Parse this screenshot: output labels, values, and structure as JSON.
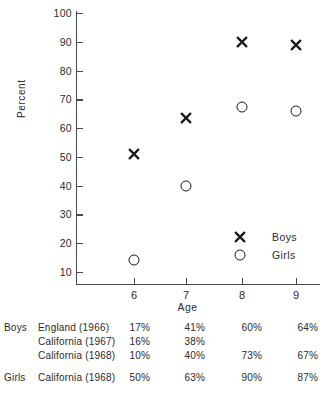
{
  "chart_data": {
    "type": "scatter",
    "title": "",
    "xlabel": "Age",
    "ylabel": "Percent",
    "x": [
      6,
      7,
      8,
      9
    ],
    "xticklabels": [
      "6",
      "7",
      "8",
      "9"
    ],
    "yticks": [
      10,
      20,
      30,
      40,
      50,
      60,
      70,
      80,
      90,
      100
    ],
    "yticklabels": [
      "10",
      "20",
      "30",
      "40",
      "50",
      "60",
      "70",
      "80",
      "90",
      "100"
    ],
    "ylim": [
      0,
      100
    ],
    "grid": false,
    "legend_position": "inside-lower-right",
    "series": [
      {
        "name": "Boys",
        "marker": "x",
        "values": [
          51,
          63.5,
          90,
          89
        ]
      },
      {
        "name": "Girls",
        "marker": "o",
        "values": [
          14,
          40,
          67.5,
          66
        ]
      }
    ],
    "table": {
      "columns": [
        "6",
        "7",
        "8",
        "9"
      ],
      "rows": [
        {
          "group": "Boys",
          "source": "England (1966)",
          "values": [
            "17%",
            "41%",
            "60%",
            "64%"
          ]
        },
        {
          "group": "",
          "source": "California (1967)",
          "values": [
            "16%",
            "38%",
            "",
            ""
          ]
        },
        {
          "group": "",
          "source": "California (1968)",
          "values": [
            "10%",
            "40%",
            "73%",
            "67%"
          ]
        },
        {
          "group": "Girls",
          "source": "California (1968)",
          "values": [
            "50%",
            "63%",
            "90%",
            "87%"
          ]
        }
      ]
    }
  },
  "legend": {
    "items": [
      {
        "symbol": "x-marker",
        "label": "Boys"
      },
      {
        "symbol": "o-marker",
        "label": "Girls"
      }
    ]
  },
  "colors": {
    "axis": "#4a4a4a",
    "text": "#2b2b2b",
    "marker": "#1a1a1a",
    "background": "#ffffff"
  }
}
